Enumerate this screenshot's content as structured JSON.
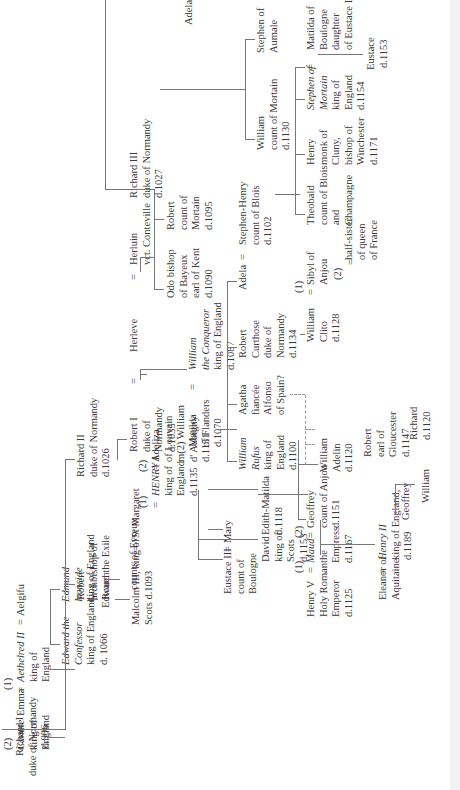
{
  "persons": {
    "richard1": {
      "lines": [
        "Richard I",
        "duke of Normandy",
        "d.996"
      ]
    },
    "robert_abp": {
      "lines": [
        "Robert",
        "archbishop of",
        "Rouen"
      ]
    },
    "evreux": {
      "lines": [
        "counts of Evreux"
      ]
    },
    "richard2": {
      "lines": [
        "Richard II",
        "duke of Normandy",
        "d.1026"
      ]
    },
    "robert1": {
      "lines": [
        "Robert I",
        "duke of",
        "Normandy",
        "d.1035"
      ]
    },
    "richard3": {
      "lines": [
        "Richard III",
        "duke of Normandy",
        "d.1027"
      ]
    },
    "herleve": {
      "lines": [
        "Herleve"
      ]
    },
    "herluin": {
      "lines": [
        "Herluin",
        "vct. Conteville"
      ]
    },
    "odo": {
      "lines": [
        "Odo bishop",
        "of Bayeux",
        "earl of Kent",
        "d.1090"
      ]
    },
    "robert_mortain": {
      "lines": [
        "Robert",
        "count of",
        "Mortain",
        "d.1095"
      ]
    },
    "adelaide": {
      "lines": [
        "Adelaide"
      ]
    },
    "william_mortain": {
      "lines": [
        "William",
        "count of Mortain",
        "d.1130"
      ]
    },
    "stephen_aumale": {
      "lines": [
        "Stephen of",
        "Aumale"
      ]
    },
    "matilda_flanders": {
      "lines": [
        "Matilda",
        "of Flanders",
        "d.1070"
      ]
    },
    "william_conq": {
      "lines": [
        "William",
        "the Conqueror",
        "king of England",
        "d.1087"
      ]
    },
    "william_rufus": {
      "lines": [
        "William",
        "Rufus",
        "king of",
        "England",
        "d.1100"
      ]
    },
    "agatha": {
      "lines": [
        "Agatha",
        "fiancée",
        "Alfonso",
        "of Spain?"
      ]
    },
    "robert_curthose": {
      "lines": [
        "Robert",
        "Curthose",
        "duke of",
        "Normandy",
        "d.1134"
      ]
    },
    "adela": {
      "lines": [
        "Adela"
      ]
    },
    "stephen_henry": {
      "lines": [
        "Stephen-Henry",
        "count of Blois",
        "d.1102"
      ]
    },
    "theobald": {
      "lines": [
        "Theobald",
        "count of Blois",
        "and",
        "Champagne"
      ]
    },
    "henry_winchester": {
      "lines": [
        "Henry",
        "monk of",
        "Cluny,",
        "bishop of",
        "Winchester",
        "d.1171"
      ]
    },
    "stephen_king": {
      "lines": [
        "Stephen of",
        "Mortain",
        "king of",
        "England",
        "d.1154"
      ]
    },
    "matilda_boulogne": {
      "lines": [
        "Matilda of",
        "Boulogne",
        "daughter",
        "of Eustace III"
      ]
    },
    "eustace": {
      "lines": [
        "Eustace",
        "d.1153"
      ]
    },
    "william_clito": {
      "lines": [
        "William",
        "Clito",
        "d.1128"
      ]
    },
    "sibyl": {
      "lines": [
        "Sibyl of",
        "Anjou"
      ]
    },
    "halfsister": {
      "lines": [
        "half-sister",
        "of queen",
        "of France"
      ]
    },
    "canute": {
      "lines": [
        "Canute",
        "king of",
        "England"
      ]
    },
    "emma": {
      "lines": [
        "Emma"
      ]
    },
    "aethelred": {
      "lines": [
        "Aethelred II",
        "king of",
        "England"
      ]
    },
    "aelgifu": {
      "lines": [
        "Aelgifu"
      ]
    },
    "edward_conf": {
      "lines": [
        "Edward the",
        "Confessor",
        "king of England",
        "d. 1066"
      ]
    },
    "edmund": {
      "lines": [
        "Edmund",
        "Ironside",
        "king of England"
      ]
    },
    "edward_exile": {
      "lines": [
        "Edward the Exile"
      ]
    },
    "malcolm": {
      "lines": [
        "Malcolm III, king of",
        "Scots d.1093"
      ]
    },
    "margaret": {
      "lines": [
        "St Margaret"
      ]
    },
    "eustace3": {
      "lines": [
        "Eustace III",
        "count of",
        "Boulogne"
      ]
    },
    "mary": {
      "lines": [
        "Mary"
      ]
    },
    "david": {
      "lines": [
        "David",
        "king of",
        "Scots",
        "d.1153"
      ]
    },
    "edith": {
      "lines": [
        "Edith-Matilda",
        "d.1118"
      ]
    },
    "henry1": {
      "lines": [
        "HENRY I",
        "king of",
        "England",
        "d.1135"
      ]
    },
    "adeliza": {
      "lines": [
        "Adeliza",
        "of Louvain",
        "m(2) William",
        "d' Aubigny",
        "d.1151"
      ]
    },
    "william_adelin": {
      "lines": [
        "William",
        "Adelin",
        "d.1120"
      ]
    },
    "robert_glouc": {
      "lines": [
        "Robert",
        "earl of",
        "Gloucester",
        "d.1147"
      ]
    },
    "richard_ill": {
      "lines": [
        "Richard",
        "d.1120"
      ]
    },
    "henry5": {
      "lines": [
        "Henry V",
        "Holy Roman",
        "Emperor",
        "d.1125"
      ]
    },
    "maud": {
      "lines": [
        "Maud",
        "the",
        "Empress",
        "d.1167"
      ]
    },
    "geoffrey_anjou": {
      "lines": [
        "Geoffrey",
        "count of Anjou",
        "d.1151"
      ]
    },
    "eleanor": {
      "lines": [
        "Eleanor of",
        "Aquitaine"
      ]
    },
    "henry2": {
      "lines": [
        "Henry II",
        "king of England,",
        "d.1189"
      ]
    },
    "geoffrey": {
      "lines": [
        "Geoffrey"
      ]
    },
    "william_son": {
      "lines": [
        "William"
      ]
    }
  },
  "marks": {
    "equals": "=",
    "m1": "(1)",
    "m2": "(2)"
  }
}
